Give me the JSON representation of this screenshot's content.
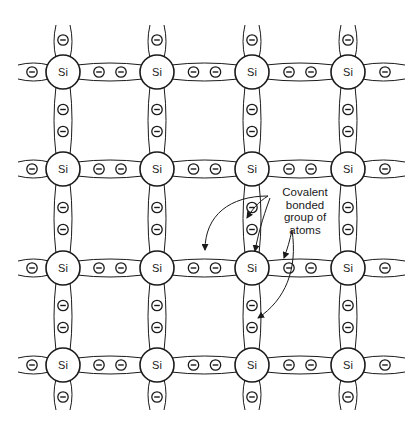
{
  "figure": {
    "type": "silicon crystal lattice with covalent bonds",
    "atom_symbol": "Si",
    "electron_symbol": "−",
    "grid": {
      "columns_x": [
        63,
        157,
        252,
        348
      ],
      "rows_y": [
        72,
        169,
        268,
        365
      ],
      "atom_radius": 17
    },
    "annotation": {
      "lines": [
        "Covalent",
        "bonded",
        "group of",
        "atoms"
      ]
    },
    "colors": {
      "stroke": "#1a1a1a",
      "background": "#ffffff"
    }
  }
}
